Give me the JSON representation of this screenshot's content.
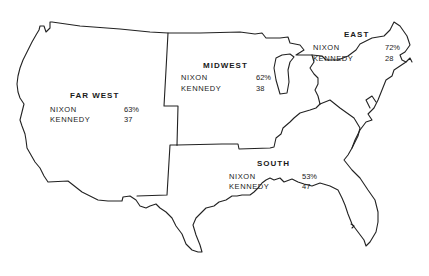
{
  "regions": {
    "far_west": {
      "name": "FAR WEST",
      "candidates": [
        {
          "name": "NIXON",
          "value": "63%"
        },
        {
          "name": "KENNEDY",
          "value": "37"
        }
      ]
    },
    "midwest": {
      "name": "MIDWEST",
      "candidates": [
        {
          "name": "NIXON",
          "value": "62%"
        },
        {
          "name": "KENNEDY",
          "value": "38"
        }
      ]
    },
    "east": {
      "name": "EAST",
      "candidates": [
        {
          "name": "NIXON",
          "value": "72%"
        },
        {
          "name": "KENNEDY",
          "value": "28"
        }
      ]
    },
    "south": {
      "name": "SOUTH",
      "candidates": [
        {
          "name": "NIXON",
          "value": "53%"
        },
        {
          "name": "KENNEDY",
          "value": "47"
        }
      ]
    }
  },
  "colors": {
    "outline": "#222222",
    "background": "#ffffff",
    "text": "#1a1a1a"
  }
}
